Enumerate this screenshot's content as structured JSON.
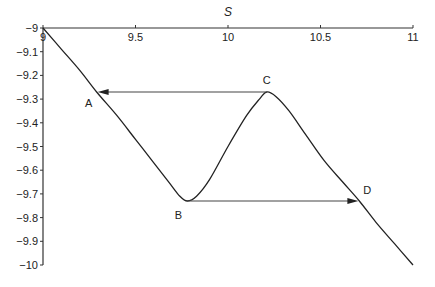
{
  "chart_data": {
    "type": "line",
    "title": "",
    "xlabel": "S",
    "ylabel": "",
    "xlim": [
      9,
      11
    ],
    "ylim": [
      -10,
      -9
    ],
    "x_axis_position": "top",
    "grid": false,
    "x_ticks": [
      9,
      9.5,
      10,
      10.5,
      11
    ],
    "x_tick_labels": [
      "9",
      "9.5",
      "10",
      "10.5",
      "11"
    ],
    "y_ticks": [
      -9,
      -9.1,
      -9.2,
      -9.3,
      -9.4,
      -9.5,
      -9.6,
      -9.7,
      -9.8,
      -9.9,
      -10
    ],
    "y_tick_labels": [
      "−9",
      "−9.1",
      "−9.2",
      "−9.3",
      "−9.4",
      "−9.5",
      "−9.6",
      "−9.7",
      "−9.8",
      "−9.9",
      "−10"
    ],
    "series": [
      {
        "name": "curve",
        "x": [
          9.0,
          9.1,
          9.2,
          9.29,
          9.4,
          9.5,
          9.6,
          9.68,
          9.74,
          9.78,
          9.83,
          9.9,
          10.0,
          10.1,
          10.17,
          10.21,
          10.26,
          10.33,
          10.42,
          10.52,
          10.62,
          10.71,
          10.8,
          10.9,
          11.0
        ],
        "y": [
          -9.0,
          -9.09,
          -9.18,
          -9.27,
          -9.37,
          -9.47,
          -9.57,
          -9.65,
          -9.71,
          -9.73,
          -9.71,
          -9.64,
          -9.5,
          -9.37,
          -9.3,
          -9.27,
          -9.29,
          -9.35,
          -9.45,
          -9.56,
          -9.65,
          -9.73,
          -9.82,
          -9.91,
          -10.0
        ]
      }
    ],
    "annotations": [
      {
        "label": "A",
        "x": 9.29,
        "y": -9.27
      },
      {
        "label": "B",
        "x": 9.77,
        "y": -9.73
      },
      {
        "label": "C",
        "x": 10.21,
        "y": -9.27
      },
      {
        "label": "D",
        "x": 10.71,
        "y": -9.73
      }
    ],
    "arrows": [
      {
        "from": "C",
        "to": "A",
        "y": -9.27,
        "x_from": 10.21,
        "x_to": 9.29
      },
      {
        "from": "B",
        "to": "D",
        "y": -9.73,
        "x_from": 9.78,
        "x_to": 10.71
      }
    ]
  }
}
